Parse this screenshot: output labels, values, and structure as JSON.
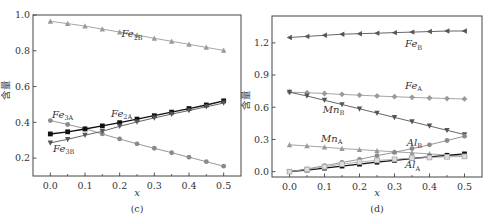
{
  "figure": {
    "panels": [
      "(c)",
      "(d)"
    ]
  },
  "chart_data": [
    {
      "type": "line",
      "panel_label": "(c)",
      "xlabel": "x",
      "ylabel": "含量",
      "xlim": [
        -0.05,
        0.55
      ],
      "ylim": [
        0.1,
        1.0
      ],
      "xticks": [
        0.0,
        0.1,
        0.2,
        0.3,
        0.4,
        0.5
      ],
      "xtick_labels": [
        "0.0",
        "0.1",
        "0.2",
        "0.3",
        "0.4",
        "0.5"
      ],
      "yticks": [
        0.2,
        0.4,
        0.6,
        0.8,
        1.0
      ],
      "ytick_labels": [
        "0.2",
        "0.4",
        "0.6",
        "0.8",
        "1.0"
      ],
      "grid": false,
      "legend": "inline labels",
      "x": [
        0.0,
        0.05,
        0.1,
        0.15,
        0.2,
        0.25,
        0.3,
        0.35,
        0.4,
        0.45,
        0.5
      ],
      "series": [
        {
          "name": "Fe2B",
          "label_main": "Fe",
          "label_sub": "2B",
          "marker": "triangle-up",
          "color": "#9a9a9a",
          "values": [
            0.965,
            0.952,
            0.938,
            0.921,
            0.905,
            0.888,
            0.87,
            0.853,
            0.836,
            0.819,
            0.802
          ],
          "label_pos": [
            0.205,
            0.875
          ]
        },
        {
          "name": "Fe3A",
          "label_main": "Fe",
          "label_sub": "3A",
          "marker": "circle",
          "color": "#8a8a8a",
          "values": [
            0.41,
            0.388,
            0.365,
            0.335,
            0.307,
            0.28,
            0.255,
            0.23,
            0.205,
            0.18,
            0.155
          ],
          "label_pos": [
            0.005,
            0.425
          ]
        },
        {
          "name": "Fe2A",
          "label_main": "Fe",
          "label_sub": "2A",
          "marker": "square",
          "color": "#111111",
          "values": [
            0.335,
            0.347,
            0.363,
            0.38,
            0.398,
            0.418,
            0.437,
            0.457,
            0.477,
            0.497,
            0.52
          ],
          "label_pos": [
            0.175,
            0.432
          ]
        },
        {
          "name": "Fe3B",
          "label_main": "Fe",
          "label_sub": "3B",
          "marker": "triangle-down",
          "color": "#555555",
          "values": [
            0.285,
            0.305,
            0.328,
            0.35,
            0.378,
            0.402,
            0.425,
            0.446,
            0.466,
            0.487,
            0.508
          ],
          "label_pos": [
            0.008,
            0.235
          ]
        }
      ]
    },
    {
      "type": "line",
      "panel_label": "(d)",
      "xlabel": "x",
      "ylabel": "含量",
      "xlim": [
        -0.05,
        0.55
      ],
      "ylim": [
        -0.05,
        1.45
      ],
      "xticks": [
        0.0,
        0.1,
        0.2,
        0.3,
        0.4,
        0.5
      ],
      "xtick_labels": [
        "0.0",
        "0.1",
        "0.2",
        "0.3",
        "0.4",
        "0.5"
      ],
      "yticks": [
        0.0,
        0.3,
        0.6,
        0.9,
        1.2
      ],
      "ytick_labels": [
        "0.0",
        "0.3",
        "0.6",
        "0.9",
        "1.2"
      ],
      "grid": false,
      "legend": "inline labels",
      "x": [
        0.0,
        0.05,
        0.1,
        0.15,
        0.2,
        0.25,
        0.3,
        0.35,
        0.4,
        0.45,
        0.5
      ],
      "series": [
        {
          "name": "FeB",
          "label_main": "Fe",
          "label_sub": "B",
          "marker": "triangle-left",
          "color": "#555555",
          "values": [
            1.25,
            1.26,
            1.27,
            1.28,
            1.285,
            1.29,
            1.295,
            1.3,
            1.305,
            1.31,
            1.31
          ],
          "label_pos": [
            0.33,
            1.16
          ]
        },
        {
          "name": "FeA",
          "label_main": "Fe",
          "label_sub": "A",
          "marker": "diamond",
          "color": "#9a9a9a",
          "values": [
            0.74,
            0.735,
            0.728,
            0.72,
            0.712,
            0.705,
            0.698,
            0.692,
            0.686,
            0.681,
            0.677
          ],
          "label_pos": [
            0.33,
            0.77
          ]
        },
        {
          "name": "MnB",
          "label_main": "Mn",
          "label_sub": "B",
          "marker": "triangle-down",
          "color": "#555555",
          "values": [
            0.74,
            0.705,
            0.665,
            0.625,
            0.585,
            0.545,
            0.505,
            0.465,
            0.425,
            0.385,
            0.345
          ],
          "label_pos": [
            0.095,
            0.55
          ]
        },
        {
          "name": "MnA",
          "label_main": "Mn",
          "label_sub": "A",
          "marker": "triangle-up",
          "color": "#9a9a9a",
          "values": [
            0.25,
            0.24,
            0.228,
            0.215,
            0.205,
            0.195,
            0.185,
            0.175,
            0.165,
            0.155,
            0.145
          ],
          "label_pos": [
            0.09,
            0.28
          ]
        },
        {
          "name": "AlB",
          "label_main": "Al",
          "label_sub": "B",
          "marker": "circle",
          "color": "#8a8a8a",
          "values": [
            0.0,
            0.025,
            0.055,
            0.085,
            0.115,
            0.148,
            0.18,
            0.215,
            0.25,
            0.29,
            0.33
          ],
          "label_pos": [
            0.335,
            0.24
          ]
        },
        {
          "name": "AlA",
          "label_main": "Al",
          "label_sub": "A",
          "marker": "square",
          "color": "#111111",
          "values": [
            0.0,
            0.015,
            0.033,
            0.052,
            0.07,
            0.088,
            0.105,
            0.122,
            0.138,
            0.152,
            0.165
          ],
          "label_pos": [
            0.33,
            0.03
          ]
        },
        {
          "name": "AlA-open",
          "label_main": "",
          "label_sub": "",
          "marker": "square-open",
          "color": "#aaaaaa",
          "values": [
            0.0,
            0.02,
            0.045,
            0.07,
            0.09,
            0.105,
            0.115,
            0.125,
            0.132,
            0.138,
            0.142
          ],
          "label_pos": null
        }
      ]
    }
  ]
}
